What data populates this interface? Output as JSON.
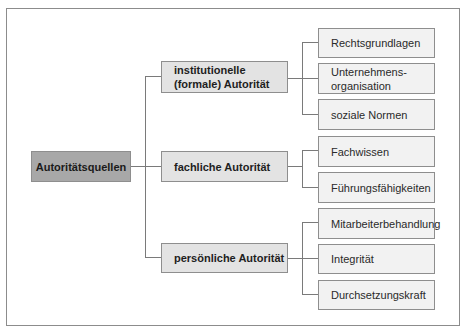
{
  "diagram": {
    "root": {
      "label": "Autoritätsquellen"
    },
    "branches": [
      {
        "label": "institutionelle (formale) Autorität",
        "label_line1": "institutionelle",
        "label_line2": "(formale) Autorität",
        "children": [
          {
            "label": "Rechtsgrundlagen"
          },
          {
            "label": "Unternehmens-organisation",
            "label_line1": "Unternehmens-",
            "label_line2": "organisation"
          },
          {
            "label": "soziale Normen"
          }
        ]
      },
      {
        "label": "fachliche Autorität",
        "children": [
          {
            "label": "Fachwissen"
          },
          {
            "label": "Führungsfähigkeiten"
          }
        ]
      },
      {
        "label": "persönliche Autorität",
        "children": [
          {
            "label": "Mitarbeiterbehandlung"
          },
          {
            "label": "Integrität"
          },
          {
            "label": "Durchsetzungskraft"
          }
        ]
      }
    ]
  },
  "colors": {
    "root_fill": "#a8a8a8",
    "level1_fill": "#e3e3e3",
    "level2_fill": "#f2f2f2",
    "border": "#8e8e8e",
    "connector": "#7a7a7a"
  }
}
